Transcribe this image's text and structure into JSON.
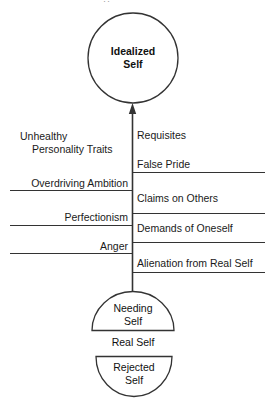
{
  "figure": {
    "width": 275,
    "height": 403,
    "stroke_color": "#333333",
    "text_color": "#1a1a1a",
    "background": "#ffffff",
    "top_cropped_artifact": "··"
  },
  "nodes": {
    "idealized_self": {
      "label_line1": "Idealized",
      "label_line2": "Self",
      "shape": "circle"
    },
    "needing_self": {
      "label_line1": "Needing",
      "label_line2": "Self",
      "shape": "upper-semicircle"
    },
    "real_self": {
      "label": "Real Self",
      "shape": "text"
    },
    "rejected_self": {
      "label_line1": "Rejected",
      "label_line2": "Self",
      "shape": "lower-semicircle"
    }
  },
  "left_column": {
    "header_line1": "Unhealthy",
    "header_line2": "Personality Traits",
    "items": [
      {
        "label": "Overdriving Ambition"
      },
      {
        "label": "Perfectionism"
      },
      {
        "label": "Anger"
      }
    ]
  },
  "right_column": {
    "items": [
      {
        "label": "Requisites"
      },
      {
        "label": "False Pride"
      },
      {
        "label": "Claims on Others"
      },
      {
        "label": "Demands of Oneself"
      },
      {
        "label": "Alienation from Real Self"
      }
    ]
  }
}
